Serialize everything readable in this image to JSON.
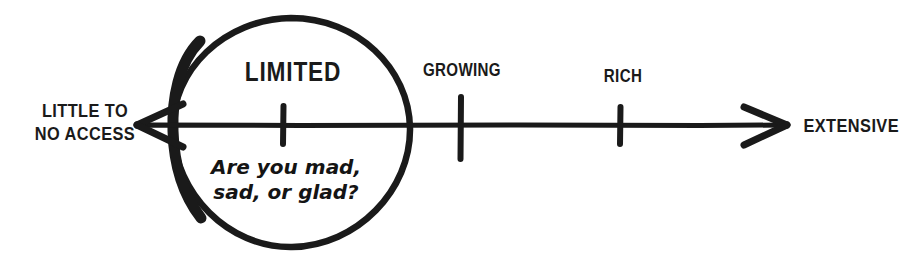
{
  "diagram": {
    "type": "spectrum-scale",
    "background_color": "#ffffff",
    "ink_color": "#1a1a1a",
    "axis": {
      "left_end_label": "LITTLE TO\nNO ACCESS",
      "right_end_label": "EXTENSIVE",
      "left_arrow_name": "left-arrowhead",
      "right_arrow_name": "right-arrowhead"
    },
    "ticks": [
      {
        "label": "LIMITED",
        "position_pct": 0
      },
      {
        "label": "GROWING",
        "position_pct": 27
      },
      {
        "label": "RICH",
        "position_pct": 52
      }
    ],
    "highlight": {
      "shape": "circle",
      "target_label": "LIMITED",
      "annotation": "Are you mad,\nsad, or glad?"
    }
  }
}
